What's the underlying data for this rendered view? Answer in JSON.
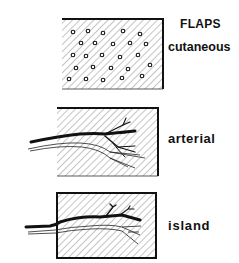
{
  "diagram": {
    "title": "FLAPS",
    "panels": [
      {
        "label": "cutaneous",
        "type": "random-pattern skin flap with dotted texture"
      },
      {
        "label": "arterial",
        "type": "flap with axial artery entering from left edge"
      },
      {
        "label": "island",
        "type": "flap isolated on vascular pedicle inside bordered box"
      }
    ]
  },
  "colors": {
    "ink": "#111111",
    "background": "#ffffff"
  }
}
